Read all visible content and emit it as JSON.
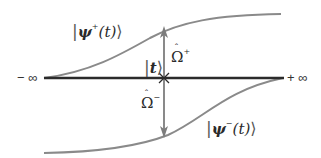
{
  "diagram": {
    "labels": {
      "psi_plus": {
        "name": "ψ",
        "sup": "+",
        "arg": "(t)"
      },
      "psi_minus": {
        "name": "ψ",
        "sup": "−",
        "arg": "(t)"
      },
      "t_ket": {
        "name": "t"
      },
      "omega_plus": {
        "name": "Ω",
        "hat": "ˆ",
        "sup": "+"
      },
      "omega_minus": {
        "name": "Ω",
        "hat": "ˆ",
        "sup": "−"
      },
      "minus_infinity": "− ∞",
      "plus_infinity": "+ ∞"
    },
    "ket_left": "|",
    "ket_right": "⟩",
    "colors": {
      "axis": "#2b2b2b",
      "curves": "#8a8a8a",
      "arrow": "#7d7d7d",
      "text": "#2a2a2a"
    }
  }
}
